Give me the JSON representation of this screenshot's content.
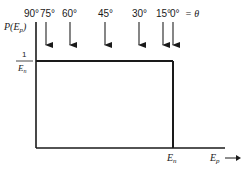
{
  "diagram": {
    "y_axis_label": "P(E",
    "y_axis_label_sub": "p",
    "y_axis_label_close": ")",
    "y_tick_numerator": "1",
    "y_tick_denominator": "E",
    "y_tick_denominator_sub": "n",
    "x_axis_label": "E",
    "x_axis_label_sub": "p",
    "x_tick_label": "E",
    "x_tick_label_sub": "n",
    "theta_suffix": "= θ",
    "angles": [
      {
        "label": "90°",
        "x": 36,
        "arrow": false
      },
      {
        "label": "75°",
        "x": 46,
        "arrow": true
      },
      {
        "label": "60°",
        "x": 70,
        "arrow": true
      },
      {
        "label": "45°",
        "x": 105,
        "arrow": true
      },
      {
        "label": "30°",
        "x": 139,
        "arrow": true
      },
      {
        "label": "15°",
        "x": 163,
        "arrow": true
      },
      {
        "label": "0°",
        "x": 173,
        "arrow": true
      }
    ],
    "colors": {
      "line": "#1a1a1a",
      "arrow": "#444444"
    }
  }
}
